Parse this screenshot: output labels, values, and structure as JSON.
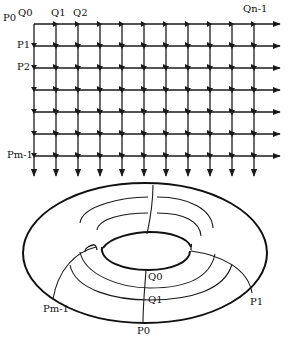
{
  "grid": {
    "rows": 7,
    "cols": 11,
    "x0": 34,
    "y0": 24,
    "dx": 22,
    "dy": 22,
    "row_labels": [
      "P0",
      "P1",
      "P2",
      "Pm-1"
    ],
    "col_labels": [
      "Q0",
      "Q1",
      "Q2",
      "Qn-1"
    ]
  },
  "torus": {
    "labels": {
      "q0": "Q0",
      "q1": "Q1",
      "p0": "P0",
      "p1": "P1",
      "pm1": "Pm-1"
    }
  },
  "colors": {
    "ink": "#1a1a1a",
    "background": "#ffffff"
  }
}
